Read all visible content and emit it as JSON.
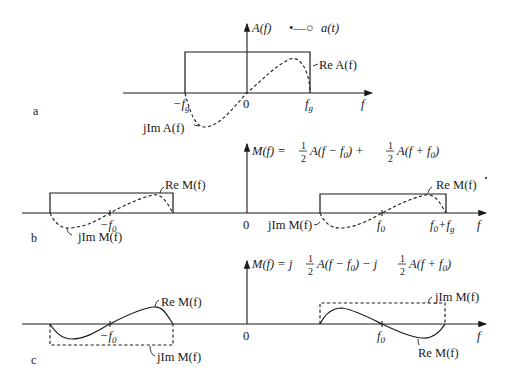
{
  "figure": {
    "panels": [
      {
        "id": "a",
        "panel_label": "a",
        "y_axis_label": "A(f)",
        "correspondence": "•—○",
        "time_signal": "a(t)",
        "x_axis_label": "f",
        "ticks": [
          "−f_g",
          "0",
          "f_g"
        ],
        "tick_text": {
          "neg": "−f",
          "neg_sub": "g",
          "zero": "0",
          "pos": "f",
          "pos_sub": "g"
        },
        "curves": {
          "real": "Re A(f)",
          "imag": "jIm A(f)"
        }
      },
      {
        "id": "b",
        "panel_label": "b",
        "equation": {
          "lhs": "M(f) = ",
          "half1": "1",
          "den1": "2",
          "term1": "A(f − f",
          "term1_sub": "0",
          "plus": ") + ",
          "half2": "1",
          "den2": "2",
          "term2": "A(f + f",
          "term2_sub": "0",
          "close": ")"
        },
        "x_axis_label": "f",
        "tick_text": {
          "neg": "−f",
          "neg_sub": "0",
          "zero": "0",
          "pos": "f",
          "pos_sub": "0",
          "edge": "f",
          "edge_sub": "0",
          "edge_plus": "+f",
          "edge_plus_sub": "g"
        },
        "curves": {
          "real_left": "Re M(f)",
          "imag_left": "jIm M(f)",
          "real_right": "Re M(f)",
          "imag_right": "jIm M(f)"
        }
      },
      {
        "id": "c",
        "panel_label": "c",
        "equation": {
          "lhs": "M(f) = j",
          "half1": "1",
          "den1": "2",
          "term1": "A(f − f",
          "term1_sub": "0",
          "minus": ") − j",
          "half2": "1",
          "den2": "2",
          "term2": "A(f + f",
          "term2_sub": "0",
          "close": ")"
        },
        "x_axis_label": "f",
        "tick_text": {
          "neg": "−f",
          "neg_sub": "0",
          "zero": "0",
          "pos": "f",
          "pos_sub": "0"
        },
        "curves": {
          "real_left": "Re M(f)",
          "imag_left": "jIm M(f)",
          "imag_right": "jIm M(f)",
          "real_right": "Re M(f)"
        }
      }
    ]
  }
}
